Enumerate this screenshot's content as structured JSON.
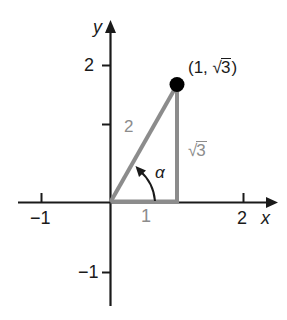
{
  "figure": {
    "kind": "coordinate-plane-right-triangle",
    "axes": {
      "x_axis_name": "x",
      "y_axis_name": "y",
      "x_ticks": [
        {
          "value": -1,
          "label": "−1"
        },
        {
          "value": 1,
          "label": "1"
        },
        {
          "value": 2,
          "label": "2"
        }
      ],
      "y_ticks": [
        {
          "value": 2,
          "label": "2"
        },
        {
          "value": 1,
          "label": ""
        },
        {
          "value": -1,
          "label": "−1"
        }
      ],
      "x_range": [
        -1.4,
        2.5
      ],
      "y_range": [
        -1.55,
        2.65
      ]
    },
    "point": {
      "label_prefix": "(1, ",
      "label_radicand": "3",
      "label_suffix": ")",
      "label_full": "(1, √3)",
      "x": 1,
      "y": 1.732
    },
    "triangle": {
      "hypotenuse_label": "2",
      "vertical_leg_radical_body": "3",
      "vertical_leg_label": "√3",
      "horizontal_leg_label": "1",
      "angle_label": "α"
    },
    "colors": {
      "axis": "#1a1a1a",
      "triangle": "#8c8c8c",
      "point": "#000000",
      "gray_text": "#8c8c8c",
      "black_text": "#1a1a1a",
      "background": "#ffffff"
    }
  }
}
